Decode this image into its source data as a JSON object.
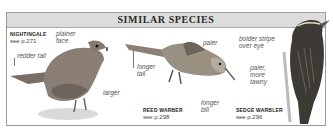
{
  "header": {
    "title": "SIMILAR SPECIES"
  },
  "species": [
    {
      "name": "NIGHTINGALE",
      "ref": "see p.271",
      "annotations": [
        "plainer face",
        "redder tail",
        "larger"
      ]
    },
    {
      "name": "REED WARBER",
      "ref": "see p.298",
      "annotations": [
        "paler",
        "longer tail",
        "longer bill"
      ]
    },
    {
      "name": "SEDGE WARBLER",
      "ref": "see p.296",
      "annotations": [
        "bolder stripe over eye",
        "paler, more tawny"
      ]
    }
  ],
  "colors": {
    "header_bg": "#dcdcdc",
    "border": "#9a9a9a"
  }
}
